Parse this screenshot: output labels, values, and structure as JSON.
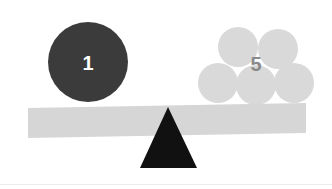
{
  "figure": {
    "type": "balance-scale-diagram",
    "width": 332,
    "height": 189,
    "background_color": "#ffffff"
  },
  "colors": {
    "background": "#ffffff",
    "beam": "#d6d6d6",
    "fulcrum": "#111111",
    "heavy_circle": "#3b3b3b",
    "heavy_label": "#ffffff",
    "light_circle": "#d9d9d9",
    "light_label": "#8a8a8a",
    "divider": "#ececec"
  },
  "beam": {
    "name": "balance-beam",
    "x1": 28,
    "y1": 108,
    "x2": 306,
    "y2": 103,
    "thickness": 30,
    "fill": "#d6d6d6"
  },
  "fulcrum": {
    "name": "fulcrum-triangle",
    "apex_x": 168,
    "apex_y": 107,
    "base_left_x": 140,
    "base_right_x": 197,
    "base_y": 168,
    "fill": "#111111"
  },
  "left_pan": {
    "label": "1",
    "count": 1,
    "circle_color": "#3b3b3b",
    "label_color": "#ffffff",
    "label_size": 20,
    "label_x": 88,
    "label_y": 63,
    "circles": [
      {
        "cx": 88,
        "cy": 62,
        "r": 40
      }
    ]
  },
  "right_pan": {
    "label": "5",
    "count": 5,
    "circle_color": "#d9d9d9",
    "label_color": "#8a8a8a",
    "label_size": 20,
    "label_x": 256,
    "label_y": 64,
    "circles": [
      {
        "cx": 238,
        "cy": 47,
        "r": 20
      },
      {
        "cx": 278,
        "cy": 49,
        "r": 20
      },
      {
        "cx": 218,
        "cy": 83,
        "r": 20
      },
      {
        "cx": 256,
        "cy": 85,
        "r": 20
      },
      {
        "cx": 294,
        "cy": 83,
        "r": 20
      }
    ]
  },
  "chart_data": {
    "type": "bar",
    "categories": [
      "left",
      "right"
    ],
    "values": [
      1,
      5
    ],
    "xlabel": "",
    "ylabel": "",
    "ylim": [
      0,
      5
    ],
    "annotations": [
      "1",
      "5"
    ]
  }
}
